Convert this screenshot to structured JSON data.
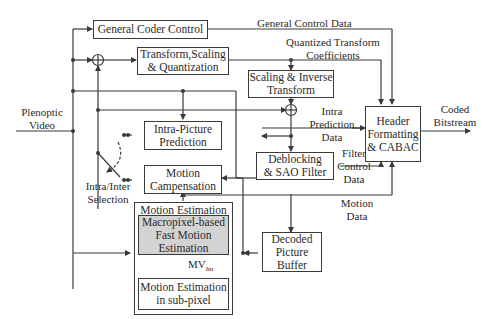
{
  "diagram": {
    "type": "block-diagram",
    "input": {
      "label_line1": "Plenoptic",
      "label_line2": "Video"
    },
    "output": {
      "label_line1": "Coded",
      "label_line2": "Bitstream"
    },
    "blocks": {
      "general_coder_control": {
        "line1": "General Coder Control"
      },
      "transform_scaling_quant": {
        "line1": "Transform,Scaling",
        "line2": "& Quantization"
      },
      "scaling_inverse_transform": {
        "line1": "Scaling & Inverse",
        "line2": "Transform"
      },
      "intra_picture_prediction": {
        "line1": "Intra-Picture",
        "line2": "Prediction"
      },
      "motion_compensation": {
        "line1": "Motion",
        "line2": "Campensation"
      },
      "deblocking_sao": {
        "line1": "Deblocking",
        "line2": "& SAO Filter"
      },
      "header_formatting": {
        "line1": "Header",
        "line2": "Formatting",
        "line3": "& CABAC"
      },
      "motion_estimation_group": {
        "title": "Motion Estimation"
      },
      "macropixel_fast_me": {
        "line1": "Macropixel-based",
        "line2": "Fast Motion",
        "line3": "Estimation"
      },
      "me_subpixel": {
        "line1": "Motion Estimation",
        "line2": "in sub-pixel"
      },
      "decoded_picture_buffer": {
        "line1": "Decoded",
        "line2": "Picture",
        "line3": "Buffer"
      }
    },
    "signals": {
      "general_control_data": "General Control Data",
      "quantized_coeffs_line1": "Quantized Transform",
      "quantized_coeffs_line2": "Coefficients",
      "intra_pred_data_line1": "Intra",
      "intra_pred_data_line2": "Prediction",
      "intra_pred_data_line3": "Data",
      "filter_control_line1": "Filter",
      "filter_control_line2": "Control",
      "filter_control_line3": "Data",
      "motion_data_line1": "Motion",
      "motion_data_line2": "Data",
      "intra_inter_line1": "Intra/Inter",
      "intra_inter_line2": "Selection",
      "mv_int": "MV",
      "mv_int_sub": "Int"
    },
    "colors": {
      "line": "#3a3a3a",
      "highlight_fill": "#d3d3d3",
      "background": "#ffffff"
    }
  }
}
